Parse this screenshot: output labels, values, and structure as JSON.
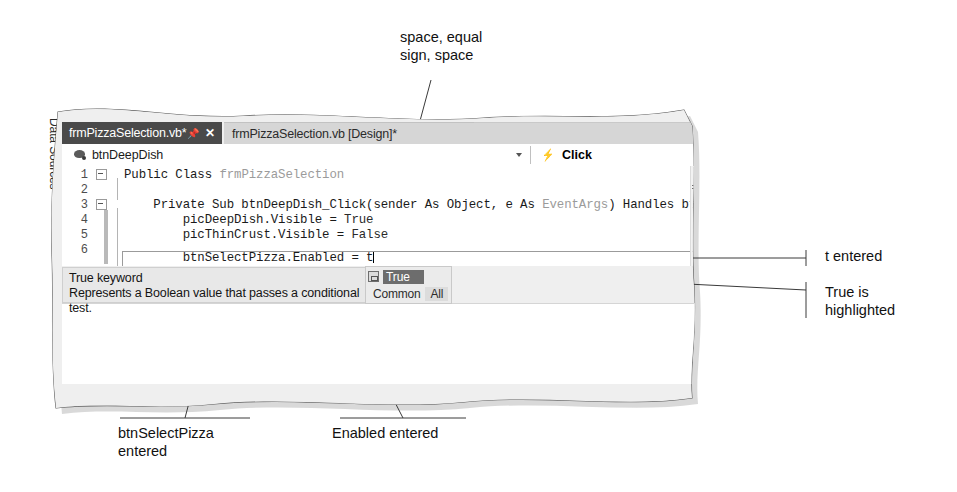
{
  "figure": {
    "kind": "textbook-annotated-screenshot",
    "application": "Visual Studio Code Editor (Visual Basic)"
  },
  "side_tab": {
    "label": "Data Sources"
  },
  "tabs": [
    {
      "label": "frmPizzaSelection.vb*",
      "active": true,
      "pin_icon": "pin-icon",
      "close_icon": "close-icon"
    },
    {
      "label": "frmPizzaSelection.vb [Design]*",
      "active": false
    }
  ],
  "navbar": {
    "class_icon": "object-icon",
    "class_name": "btnDeepDish",
    "dropdown_icon": "chevron-down-icon",
    "event_icon": "lightning-bolt-icon",
    "method_name": "Click"
  },
  "editor": {
    "line_numbers": [
      "1",
      "2",
      "3",
      "4",
      "5",
      "6"
    ],
    "lines": [
      {
        "number": "1",
        "fold": "collapse-box",
        "segments": [
          {
            "text": "Public Class ",
            "style": "keyword"
          },
          {
            "text": "frmPizzaSelection",
            "style": "type"
          }
        ]
      },
      {
        "number": "2",
        "fold": "",
        "segments": []
      },
      {
        "number": "3",
        "fold": "collapse-box",
        "segments": [
          {
            "text": "    Private Sub btnDeepDish_Click(sender As Object, e As ",
            "style": "keyword"
          },
          {
            "text": "EventArgs",
            "style": "type"
          },
          {
            "text": ") Handles btnDeepDish.Cl",
            "style": "keyword"
          }
        ]
      },
      {
        "number": "4",
        "fold": "",
        "segments": [
          {
            "text": "        picDeepDish.Visible = ",
            "style": "keyword"
          },
          {
            "text": "True",
            "style": "literal"
          }
        ]
      },
      {
        "number": "5",
        "fold": "",
        "segments": [
          {
            "text": "        picThinCrust.Visible = ",
            "style": "keyword"
          },
          {
            "text": "False",
            "style": "literal"
          }
        ]
      },
      {
        "number": "6",
        "fold": "",
        "current": true,
        "segments": [
          {
            "text": "        btnSelectPizza.Enabled = t",
            "style": "keyword"
          }
        ]
      }
    ],
    "cursor_after": "t",
    "scrollbar_up_icon": "scroll-up-arrow-icon",
    "splitter_icon": "split-editor-icon"
  },
  "quick_info": {
    "title": "True keyword",
    "description": "Represents a Boolean value that passes a conditional test."
  },
  "intellisense": {
    "item_icon": "constant-icon",
    "selected_item": "True",
    "tabs": [
      "Common",
      "All"
    ],
    "selected_tab": "All",
    "highlight_color": "#6d6d6d"
  },
  "annotations": [
    {
      "id": "space-equal",
      "text": "space, equal\nsign, space"
    },
    {
      "id": "t-entered",
      "text": "t entered"
    },
    {
      "id": "true-highlighted",
      "text": "True is\nhighlighted"
    },
    {
      "id": "btnselectpizza-entered",
      "text": "btnSelectPizza\nentered"
    },
    {
      "id": "enabled-entered",
      "text": "Enabled entered"
    }
  ],
  "colors": {
    "tab_active_bg": "#4a4a4a",
    "tab_inactive_bg": "#d6d6d6",
    "chrome_bg": "#efefef",
    "editor_bg": "#ffffff",
    "tooltip_bg": "#e8e8e8",
    "type_text": "#9b9b9b",
    "code_text": "#1a1a1a"
  }
}
